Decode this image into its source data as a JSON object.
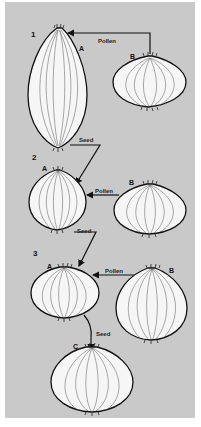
{
  "diagram": {
    "title": "",
    "background_color": "#c9c9c9",
    "stages": [
      {
        "number": "1",
        "plants": [
          {
            "id": "A",
            "shape": "tall elongated bulb"
          },
          {
            "id": "B",
            "shape": "flat round bulb"
          }
        ],
        "arrows": [
          {
            "from": "B",
            "to": "A",
            "label": "Pollen"
          },
          {
            "from": "A",
            "to": "stage-2 A",
            "label": "Seed"
          }
        ]
      },
      {
        "number": "2",
        "plants": [
          {
            "id": "A",
            "shape": "rounded bulb"
          },
          {
            "id": "B",
            "shape": "flat round bulb"
          }
        ],
        "arrows": [
          {
            "from": "B",
            "to": "A",
            "label": "Pollen"
          },
          {
            "from": "A",
            "to": "stage-3 A",
            "label": "Seed"
          }
        ]
      },
      {
        "number": "3",
        "plants": [
          {
            "id": "A",
            "shape": "flattened bulb"
          },
          {
            "id": "B",
            "shape": "large globe bulb"
          }
        ],
        "arrows": [
          {
            "from": "B",
            "to": "A",
            "label": "Pollen"
          },
          {
            "from": "A",
            "to": "C",
            "label": "Seed"
          }
        ]
      }
    ],
    "result": {
      "id": "C",
      "shape": "large round bulb"
    },
    "labels": {
      "stage1": "1",
      "stage2": "2",
      "stage3": "3",
      "a1": "A",
      "b1": "B",
      "a2": "A",
      "b2": "B",
      "a3": "A",
      "b3": "B",
      "c": "C",
      "pollen1": "Pollen",
      "pollen2": "Pollen",
      "pollen3": "Pollen",
      "seed1": "Seed",
      "seed2": "Seed",
      "seed3": "Seed"
    }
  }
}
